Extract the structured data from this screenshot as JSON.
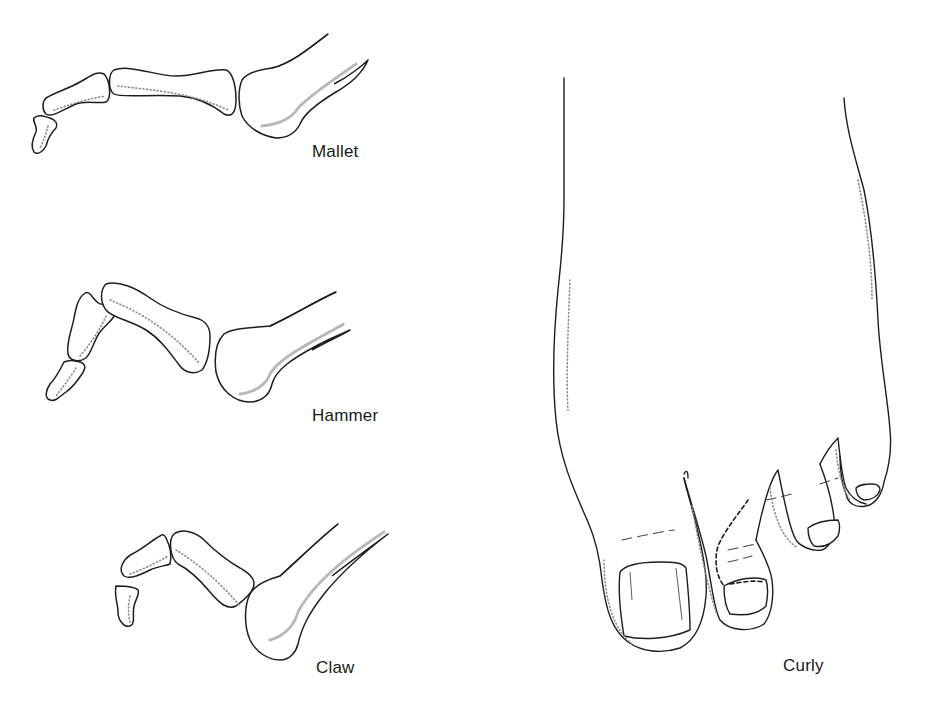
{
  "figure": {
    "panels": [
      {
        "id": "mallet",
        "label": "Mallet",
        "view": "lateral skeletal"
      },
      {
        "id": "hammer",
        "label": "Hammer",
        "view": "lateral skeletal"
      },
      {
        "id": "claw",
        "label": "Claw",
        "view": "lateral skeletal"
      },
      {
        "id": "curly",
        "label": "Curly",
        "view": "dorsal foot"
      }
    ]
  },
  "colors": {
    "line": "#1e1e1e",
    "stipple": "#8a8a8a",
    "background": "#ffffff"
  }
}
